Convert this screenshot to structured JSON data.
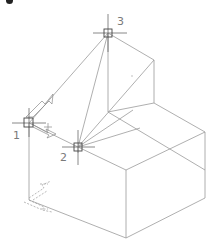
{
  "canvas": {
    "background": "#ffffff",
    "edge_color": "#9a9a9a",
    "crosshair_color": "#6a6a6a"
  },
  "points": [
    {
      "id": "1",
      "label": "1"
    },
    {
      "id": "2",
      "label": "2"
    },
    {
      "id": "3",
      "label": "3"
    }
  ]
}
